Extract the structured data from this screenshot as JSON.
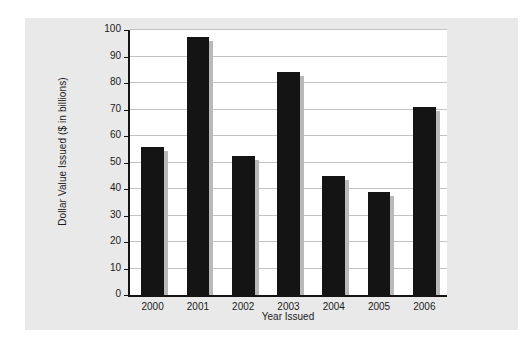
{
  "chart_data": {
    "type": "bar",
    "title": "",
    "xlabel": "Year Issued",
    "ylabel": "Dollar Value Issued ($ in billions)",
    "categories": [
      "2000",
      "2001",
      "2002",
      "2003",
      "2004",
      "2005",
      "2006"
    ],
    "values": [
      56,
      97.5,
      52.5,
      84,
      45,
      38.8,
      71
    ],
    "ylim": [
      0,
      100
    ],
    "ytick_labels": [
      "0",
      "10",
      "20",
      "30",
      "40",
      "50",
      "60",
      "70",
      "80",
      "90",
      "100"
    ],
    "ytick_values": [
      0,
      10,
      20,
      30,
      40,
      50,
      60,
      70,
      80,
      90,
      100
    ],
    "grid": true,
    "legend": false,
    "colors": {
      "bar": "#141414",
      "bar_shadow": "#b9b9b9",
      "panel_background": "#e9e9e9",
      "plot_background": "#ffffff",
      "gridline": "#c2c2c2",
      "axis": "#141414",
      "text": "#1b1b1b"
    }
  }
}
